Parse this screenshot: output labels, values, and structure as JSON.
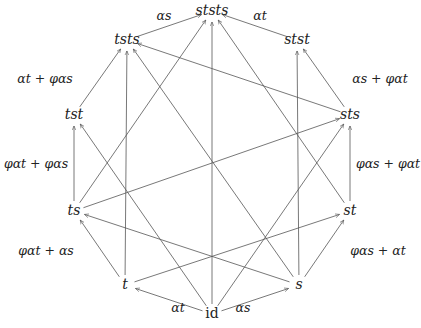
{
  "diagram": {
    "nodes": [
      {
        "id": "id",
        "label": "id",
        "x": 212,
        "y": 318
      },
      {
        "id": "t",
        "label": "t",
        "x": 125,
        "y": 289
      },
      {
        "id": "s",
        "label": "s",
        "x": 299,
        "y": 289
      },
      {
        "id": "ts",
        "label": "ts",
        "x": 74,
        "y": 215
      },
      {
        "id": "st",
        "label": "st",
        "x": 350,
        "y": 215
      },
      {
        "id": "tst",
        "label": "tst",
        "x": 74,
        "y": 119
      },
      {
        "id": "sts",
        "label": "sts",
        "x": 350,
        "y": 119
      },
      {
        "id": "tsts",
        "label": "tsts",
        "x": 127,
        "y": 44
      },
      {
        "id": "stst",
        "label": "stst",
        "x": 297,
        "y": 44
      },
      {
        "id": "ststs",
        "label": "ststs",
        "x": 212,
        "y": 15
      }
    ],
    "edge_labels": [
      {
        "text": "α_t",
        "display": "αt",
        "x": 178,
        "y": 312
      },
      {
        "text": "α_s",
        "display": "αs",
        "x": 243,
        "y": 312
      },
      {
        "text": "φα_t + α_s",
        "display": "φαt + αs",
        "x": 46,
        "y": 255
      },
      {
        "text": "φα_s + α_t",
        "display": "φαs + αt",
        "x": 378,
        "y": 255
      },
      {
        "text": "φα_t + φα_s",
        "display": "φαt + φαs",
        "x": 36,
        "y": 168
      },
      {
        "text": "φα_s + φα_t",
        "display": "φαs + φαt",
        "x": 388,
        "y": 168
      },
      {
        "text": "α_t + φα_s",
        "display": "αt + φαs",
        "x": 45,
        "y": 83
      },
      {
        "text": "α_s + φα_t",
        "display": "αs + φαt",
        "x": 380,
        "y": 83
      },
      {
        "text": "α_s",
        "display": "αs",
        "x": 164,
        "y": 20
      },
      {
        "text": "α_t",
        "display": "αt",
        "x": 260,
        "y": 20
      }
    ]
  }
}
